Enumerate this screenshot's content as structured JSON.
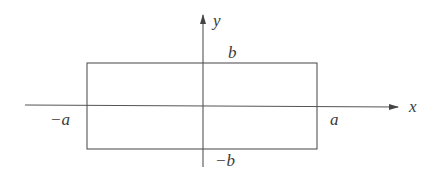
{
  "diagram": {
    "type": "coordinate-rectangle",
    "axes": {
      "x_label": "x",
      "y_label": "y"
    },
    "rectangle": {
      "x_min_label": "−a",
      "x_max_label": "a",
      "y_max_label": "b",
      "y_min_label": "−b"
    },
    "colors": {
      "line": "#555555",
      "text": "#3a3a3a",
      "background": "#ffffff"
    }
  }
}
